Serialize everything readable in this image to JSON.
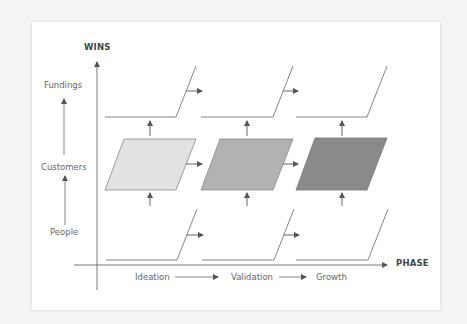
{
  "diagram": {
    "y_axis": {
      "title": "WINS",
      "levels": [
        "People",
        "Customers",
        "Fundings"
      ]
    },
    "x_axis": {
      "title": "PHASE",
      "phases": [
        "Ideation",
        "Validation",
        "Growth"
      ]
    },
    "phase_fills": [
      "#e2e2e2",
      "#b2b2b2",
      "#8a8a8a"
    ],
    "colors": {
      "line": "#666666",
      "text": "#666666",
      "title": "#444444",
      "background": "#ffffff"
    }
  }
}
